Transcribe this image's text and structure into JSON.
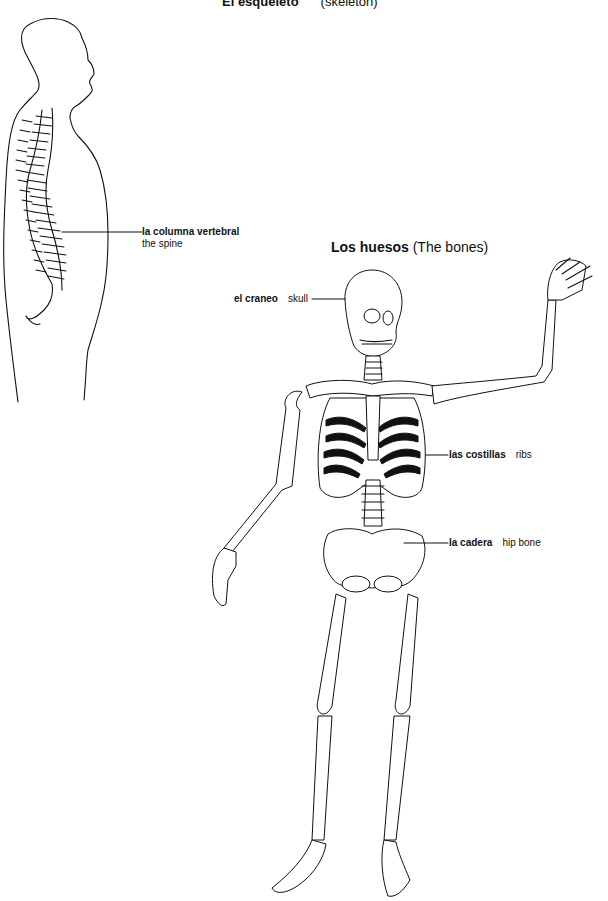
{
  "title": {
    "spanish": "El esqueleto",
    "english": "(skeleton)"
  },
  "spine_figure": {
    "label_es": "la columna vertebral",
    "label_en": "the spine"
  },
  "bones_section": {
    "heading_es": "Los huesos",
    "heading_en": "(The bones)",
    "labels": [
      {
        "es": "el craneo",
        "en": "skull"
      },
      {
        "es": "las costillas",
        "en": "ribs"
      },
      {
        "es": "la cadera",
        "en": "hip bone"
      }
    ]
  },
  "colors": {
    "ink": "#111111",
    "background": "#ffffff"
  }
}
